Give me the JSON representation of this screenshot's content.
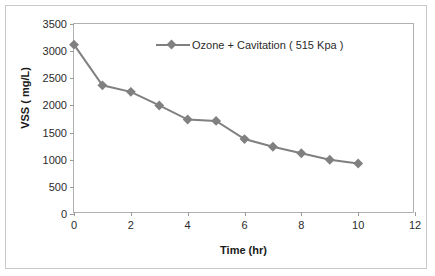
{
  "chart_data": {
    "type": "line",
    "title": "",
    "xlabel": "Time (hr)",
    "ylabel": "VSS ( mg/L)",
    "xlim": [
      0,
      12
    ],
    "ylim": [
      0,
      3500
    ],
    "xticks": [
      0,
      2,
      4,
      6,
      8,
      10,
      12
    ],
    "yticks": [
      0,
      500,
      1000,
      1500,
      2000,
      2500,
      3000,
      3500
    ],
    "grid": false,
    "legend_position": "top-right",
    "series": [
      {
        "name": "Ozone + Cavitation ( 515 Kpa )",
        "color": "#808080",
        "marker": "diamond",
        "x": [
          0,
          1,
          2,
          3,
          4,
          5,
          6,
          7,
          8,
          9,
          10
        ],
        "values": [
          3120,
          2370,
          2250,
          2000,
          1740,
          1715,
          1380,
          1240,
          1120,
          1000,
          930
        ]
      }
    ]
  },
  "axes": {
    "x_title": "Time (hr)",
    "y_title": "VSS ( mg/L)",
    "x_tick_labels": [
      "0",
      "2",
      "4",
      "6",
      "8",
      "10",
      "12"
    ],
    "y_tick_labels": [
      "0",
      "500",
      "1000",
      "1500",
      "2000",
      "2500",
      "3000",
      "3500"
    ]
  },
  "legend": {
    "entries": [
      {
        "label": "Ozone + Cavitation ( 515 Kpa )",
        "color": "#808080",
        "marker": "diamond-marker"
      }
    ]
  },
  "colors": {
    "series": "#808080",
    "axis": "#b0b0b0",
    "frame": "#c9c9c9",
    "text": "#2b2b2b"
  }
}
